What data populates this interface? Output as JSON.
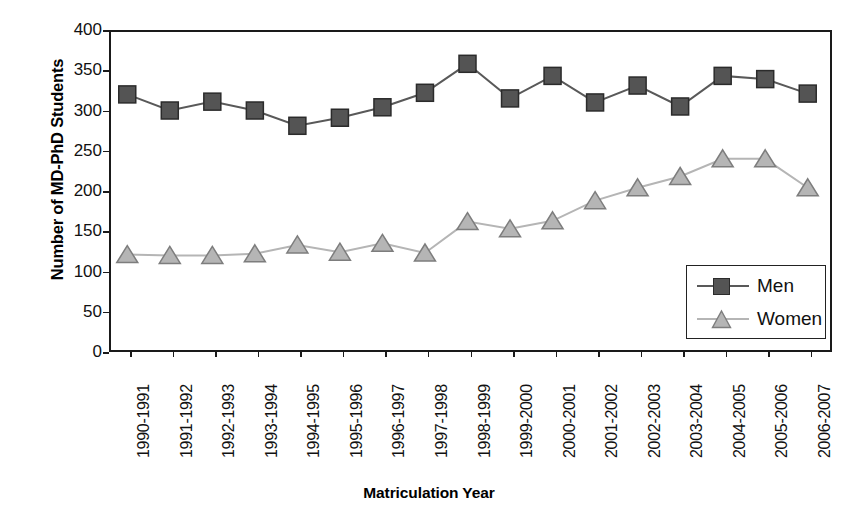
{
  "chart_data": {
    "type": "line",
    "title": "",
    "xlabel": "Matriculation Year",
    "ylabel": "Number of MD-PhD Students",
    "ylim": [
      0,
      400
    ],
    "ytick_step": 50,
    "yticks": [
      400,
      350,
      300,
      250,
      200,
      150,
      100,
      50,
      0
    ],
    "grid": false,
    "legend_position": "bottom-right",
    "categories": [
      "1990-1991",
      "1991-1992",
      "1992-1993",
      "1993-1994",
      "1994-1995",
      "1995-1996",
      "1996-1997",
      "1997-1998",
      "1998-1999",
      "1999-2000",
      "2000-2001",
      "2001-2002",
      "2002-2003",
      "2003-2004",
      "2004-2005",
      "2005-2006",
      "2006-2007"
    ],
    "series": [
      {
        "name": "Men",
        "marker": "square",
        "color": "#545454",
        "line_color": "#595959",
        "values": [
          320,
          300,
          311,
          300,
          281,
          291,
          304,
          322,
          358,
          315,
          343,
          310,
          331,
          305,
          343,
          339,
          321
        ]
      },
      {
        "name": "Women",
        "marker": "triangle",
        "color": "#b5b5b5",
        "line_color": "#b5b5b5",
        "values": [
          121,
          120,
          120,
          122,
          133,
          124,
          135,
          123,
          162,
          153,
          163,
          188,
          204,
          218,
          240,
          240,
          204
        ]
      }
    ]
  },
  "legend": {
    "items": [
      {
        "label": "Men"
      },
      {
        "label": "Women"
      }
    ]
  },
  "axes": {
    "y_axis_title": "Number of MD-PhD Students",
    "x_axis_title": "Matriculation Year"
  },
  "colors": {
    "men": "#545454",
    "women": "#b5b5b5",
    "axis": "#1a1a1a",
    "background": "#ffffff"
  }
}
